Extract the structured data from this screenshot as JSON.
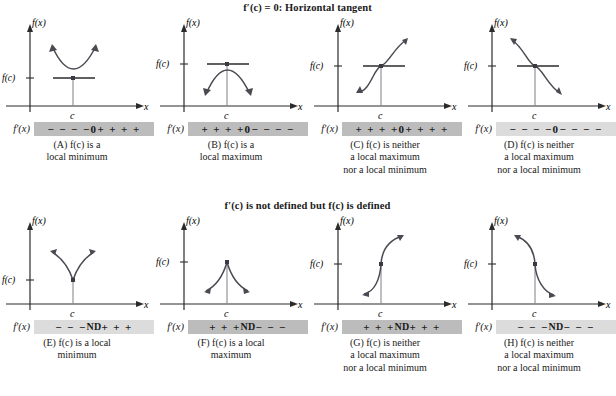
{
  "figure": {
    "sections": [
      {
        "id": "horizontal-tangent",
        "title": "f′(c) = 0: Horizontal tangent",
        "panels": [
          {
            "id": "A",
            "curve": "parabola-up",
            "axis_y_label": "f(x)",
            "axis_x_label": "x",
            "fc_label": "f(c)",
            "c_label": "c",
            "deriv_label": "f′(x)",
            "sign_left": "− − − −",
            "sign_center": "0",
            "sign_right": "+ + + +",
            "bar_shade": "dark",
            "caption_main": "(A)  f(c) is a",
            "caption_cont": "local minimum"
          },
          {
            "id": "B",
            "curve": "parabola-down",
            "axis_y_label": "f(x)",
            "axis_x_label": "x",
            "fc_label": "f(c)",
            "c_label": "c",
            "deriv_label": "f′(x)",
            "sign_left": "+ + + +",
            "sign_center": "0",
            "sign_right": "− − − −",
            "bar_shade": "dark",
            "caption_main": "(B)  f(c) is a",
            "caption_cont": "local maximum"
          },
          {
            "id": "C",
            "curve": "inflection-increasing",
            "axis_y_label": "f(x)",
            "axis_x_label": "x",
            "fc_label": "f(c)",
            "c_label": "c",
            "deriv_label": "f′(x)",
            "sign_left": "+ + + +",
            "sign_center": "0",
            "sign_right": "+ + + +",
            "bar_shade": "dark",
            "caption_main": "(C)  f(c) is neither",
            "caption_cont": "a local maximum",
            "caption_cont2": "nor a local minimum"
          },
          {
            "id": "D",
            "curve": "inflection-decreasing",
            "axis_y_label": "f(x)",
            "axis_x_label": "x",
            "fc_label": "f(c)",
            "c_label": "c",
            "deriv_label": "f′(x)",
            "sign_left": "− − − −",
            "sign_center": "0",
            "sign_right": "− − − −",
            "bar_shade": "light",
            "caption_main": "(D)  f(c) is neither",
            "caption_cont": "a local maximum",
            "caption_cont2": "nor a local minimum"
          }
        ]
      },
      {
        "id": "not-differentiable",
        "title": "f′(c) is not defined but f(c) is defined",
        "panels": [
          {
            "id": "E",
            "curve": "cusp-up",
            "axis_y_label": "f(x)",
            "axis_x_label": "x",
            "fc_label": "f(c)",
            "c_label": "c",
            "deriv_label": "f′(x)",
            "sign_left": "− − −",
            "sign_center": "ND",
            "sign_right": "+ + +",
            "bar_shade": "light",
            "caption_main": "(E)  f(c) is a local",
            "caption_cont": "minimum"
          },
          {
            "id": "F",
            "curve": "cusp-down",
            "axis_y_label": "f(x)",
            "axis_x_label": "x",
            "fc_label": "f(c)",
            "c_label": "c",
            "deriv_label": "f′(x)",
            "sign_left": "+ + +",
            "sign_center": "ND",
            "sign_right": "− − −",
            "bar_shade": "dark",
            "caption_main": "(F)  f(c) is a local",
            "caption_cont": "maximum"
          },
          {
            "id": "G",
            "curve": "vertical-tangent-increasing",
            "axis_y_label": "f(x)",
            "axis_x_label": "x",
            "fc_label": "f(c)",
            "c_label": "c",
            "deriv_label": "f′(x)",
            "sign_left": "+ + +",
            "sign_center": "ND",
            "sign_right": "+ + +",
            "bar_shade": "dark",
            "caption_main": "(G)  f(c) is neither",
            "caption_cont": "a local maximum",
            "caption_cont2": "nor a local minimum"
          },
          {
            "id": "H",
            "curve": "vertical-tangent-decreasing",
            "axis_y_label": "f(x)",
            "axis_x_label": "x",
            "fc_label": "f(c)",
            "c_label": "c",
            "deriv_label": "f′(x)",
            "sign_left": "− − −",
            "sign_center": "ND",
            "sign_right": "− − −",
            "bar_shade": "light",
            "caption_main": "(H)  f(c) is neither",
            "caption_cont": "a local maximum",
            "caption_cont2": "nor a local minimum"
          }
        ]
      }
    ]
  },
  "colors": {
    "curve": "#4a4a52",
    "axis": "#2b2b2b",
    "bar_dark": "#bcbcbc",
    "bar_light": "#dcdcdc",
    "text": "#1a1a1a"
  }
}
